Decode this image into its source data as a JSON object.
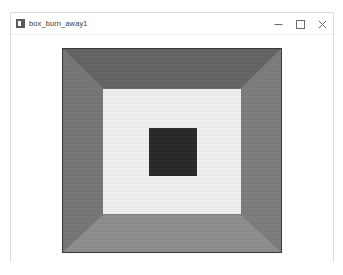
{
  "window": {
    "title": "box_burn_away1",
    "icon": "image-file-icon",
    "controls": {
      "minimize_label": "Minimize",
      "maximize_label": "Maximize",
      "close_label": "Close"
    }
  },
  "image": {
    "name": "box_burn_away1",
    "description": "Perspective render of an open box interior viewed head-on, with four shaded trapezoidal side walls, a light back wall and a dark square at the center.",
    "regions": [
      {
        "name": "top-wall",
        "color": "#636363"
      },
      {
        "name": "left-wall",
        "color": "#767676"
      },
      {
        "name": "right-wall",
        "color": "#7c7c7c"
      },
      {
        "name": "bottom-wall",
        "color": "#8d8d8d"
      },
      {
        "name": "back-wall",
        "color": "#f2f2f2"
      },
      {
        "name": "center-square",
        "color": "#262626"
      }
    ],
    "border_color": "#3a3a3a",
    "background_color": "#ffffff"
  }
}
